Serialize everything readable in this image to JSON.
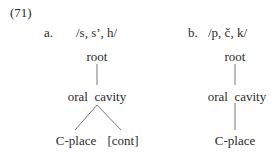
{
  "example": {
    "number": "(71)",
    "a": {
      "label": "a.",
      "segments": "/s, sʼ, h/",
      "nodes": {
        "root": "root",
        "oral_cavity": "oral  cavity",
        "c_place": "C-place",
        "cont": "[cont]"
      }
    },
    "b": {
      "label": "b.",
      "segments": "/p, č, k/",
      "nodes": {
        "root": "root",
        "oral_cavity": "oral  cavity",
        "c_place": "C-place"
      }
    }
  },
  "colors": {
    "text": "#2a2a2a",
    "line": "#555555"
  }
}
